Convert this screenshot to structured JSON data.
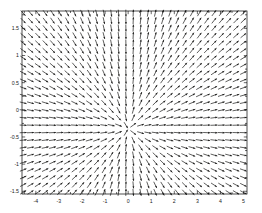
{
  "figure": {
    "title": "",
    "background_color": "#ffffff",
    "width": 262,
    "height": 213
  },
  "plot_box": {
    "left": 22,
    "top": 11,
    "right": 247,
    "bottom": 194
  },
  "axes": {
    "x_label": "",
    "y_label": "",
    "x_tick_labels": [
      "-4",
      "-3",
      "-2",
      "-1",
      "0",
      "1",
      "2",
      "3",
      "4",
      "5"
    ],
    "x_tick_values": [
      -4,
      -3,
      -2,
      -1,
      0,
      1,
      2,
      3,
      4,
      5
    ],
    "y_tick_labels": [
      "1.5",
      "1",
      "0.5",
      "0",
      "-0.5",
      "-1",
      "-1.5"
    ],
    "y_tick_values": [
      1.5,
      1,
      0.5,
      0,
      -0.5,
      -1,
      -1.5
    ],
    "axis_color": "#000000",
    "tick_label_color": "#1a1a1a"
  },
  "chart_data": {
    "type": "scatter",
    "subtype": "quiver-direction-field",
    "title": "",
    "xlabel": "",
    "ylabel": "",
    "xlim": [
      -4.6,
      5.15
    ],
    "ylim": [
      -1.55,
      1.82
    ],
    "grid": false,
    "legend": null,
    "arrow_color": "#20201f",
    "nx": 31,
    "ny": 25,
    "x_start": -4.55,
    "x_step": 0.318,
    "y_start": -1.52,
    "y_step": 0.1375,
    "slope_formula": "dy/dx = (y + 0.35) / x",
    "singularity_x": 0.0,
    "arrow_length_px": 7.0,
    "sample_points": [
      {
        "x": -4.55,
        "y": 1.72,
        "slope": 0.45
      },
      {
        "x": -4.55,
        "y": 0.0,
        "slope": 0.077
      },
      {
        "x": -4.55,
        "y": -1.52,
        "slope": 0.257
      },
      {
        "x": -2.0,
        "y": 1.0,
        "slope": 0.675
      },
      {
        "x": -2.0,
        "y": 0.0,
        "slope": 0.175
      },
      {
        "x": -2.0,
        "y": -1.0,
        "slope": 0.325
      },
      {
        "x": -0.3,
        "y": 1.0,
        "slope": 4.5
      },
      {
        "x": -0.3,
        "y": -1.0,
        "slope": 2.17
      },
      {
        "x": 0.3,
        "y": 1.0,
        "slope": 4.5
      },
      {
        "x": 0.3,
        "y": -1.0,
        "slope": -2.17
      },
      {
        "x": 2.0,
        "y": 1.0,
        "slope": 0.675
      },
      {
        "x": 2.0,
        "y": -1.0,
        "slope": -0.325
      },
      {
        "x": 5.0,
        "y": 1.72,
        "slope": 0.414
      },
      {
        "x": 5.0,
        "y": -1.52,
        "slope": -0.234
      }
    ]
  }
}
